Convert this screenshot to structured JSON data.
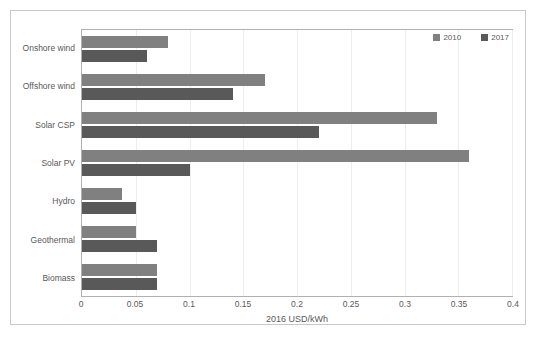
{
  "chart_data": {
    "type": "bar",
    "orientation": "horizontal",
    "title": "",
    "xlabel": "2016 USD/kWh",
    "ylabel": "",
    "xlim": [
      0,
      0.4
    ],
    "xticks": [
      "0",
      "0.05",
      "0.1",
      "0.15",
      "0.2",
      "0.25",
      "0.3",
      "0.35",
      "0.4"
    ],
    "xtick_values": [
      0,
      0.05,
      0.1,
      0.15,
      0.2,
      0.25,
      0.3,
      0.35,
      0.4
    ],
    "grid": true,
    "grid_axis": "x",
    "legend_position": "top-right",
    "categories": [
      "Onshore wind",
      "Offshore wind",
      "Solar CSP",
      "Solar PV",
      "Hydro",
      "Geothermal",
      "Biomass"
    ],
    "series": [
      {
        "name": "2010",
        "color": "#808080",
        "values": [
          0.08,
          0.17,
          0.33,
          0.36,
          0.037,
          0.05,
          0.07
        ]
      },
      {
        "name": "2017",
        "color": "#595959",
        "values": [
          0.06,
          0.14,
          0.22,
          0.1,
          0.05,
          0.07,
          0.07
        ]
      }
    ]
  },
  "legend": {
    "items": [
      {
        "label": "2010",
        "color": "#808080"
      },
      {
        "label": "2017",
        "color": "#595959"
      }
    ]
  },
  "colors": {
    "series_2010": "#808080",
    "series_2017": "#595959",
    "frame_border": "#c8c8c8",
    "plot_border": "#b0b0b0",
    "gridline": "#ededed",
    "text": "#595959"
  }
}
